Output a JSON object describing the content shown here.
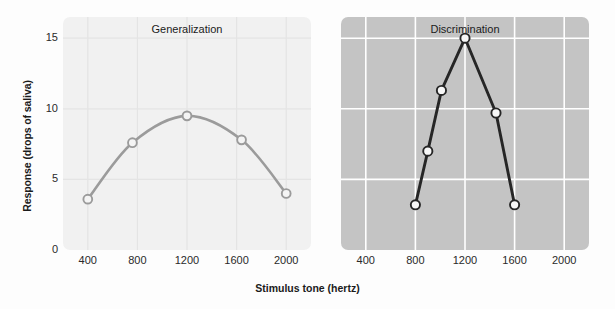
{
  "figure": {
    "background_color": "#fdfdfd",
    "y_axis_title": "Response (drops of saliva)",
    "x_axis_title": "Stimulus tone (hertz)"
  },
  "chart_data": {
    "type": "line",
    "title": "",
    "xlabel": "Stimulus tone (hertz)",
    "ylabel": "Response (drops of saliva)",
    "xlim": [
      200,
      2200
    ],
    "ylim": [
      0,
      16.5
    ],
    "xticks": [
      400,
      800,
      1200,
      1600,
      2000
    ],
    "xtick_labels": [
      "400",
      "800",
      "1200",
      "1600",
      "2000"
    ],
    "yticks": [
      0,
      5,
      10,
      15
    ],
    "ytick_labels": [
      "0",
      "5",
      "10",
      "15"
    ],
    "grid": true,
    "legend": "none",
    "panels": [
      {
        "name": "generalization",
        "title": "Generalization",
        "panel_background": "#f1f1f1",
        "grid_color": "#e4e4e4",
        "line_color": "#9b9b9b",
        "marker_face_color": "#f4f4f4",
        "marker_edge_color": "#9b9b9b",
        "x": [
          400,
          760,
          1200,
          1640,
          2000
        ],
        "y": [
          3.6,
          7.6,
          9.5,
          7.8,
          4.0
        ]
      },
      {
        "name": "discrimination",
        "title": "Discrimination",
        "panel_background": "#c4c4c4",
        "grid_color": "#ffffff",
        "line_color": "#262626",
        "marker_face_color": "#f7f7f7",
        "marker_edge_color": "#262626",
        "x": [
          800,
          900,
          1010,
          1200,
          1450,
          1600
        ],
        "y": [
          3.2,
          7.0,
          11.3,
          15.0,
          9.7,
          3.2
        ]
      }
    ]
  }
}
